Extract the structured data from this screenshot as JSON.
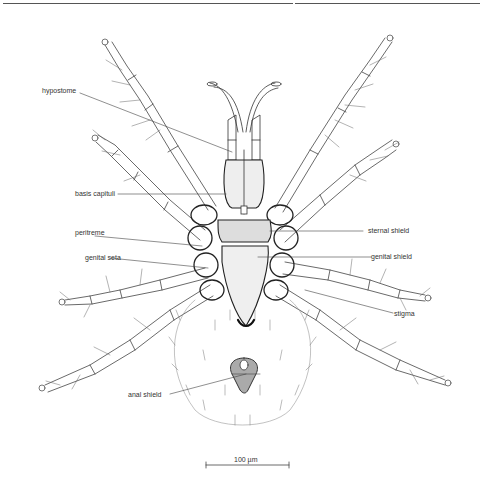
{
  "figure": {
    "labels": {
      "hypostome": "hypostome",
      "basis_capituli": "basis capituli",
      "peritreme": "peritreme",
      "genital_seta": "genital seta",
      "sternal_shield": "sternal shield",
      "genital_shield": "genital shield",
      "stigma": "stigma",
      "anal_shield": "anal shield"
    },
    "scale_bar": {
      "label": "100 µm"
    }
  }
}
